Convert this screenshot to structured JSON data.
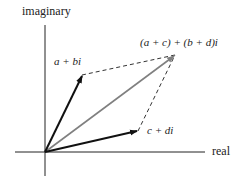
{
  "diagram": {
    "type": "complex-plane vector addition (parallelogram rule)",
    "axes": {
      "x_label": "real",
      "y_label": "imaginary"
    },
    "vectors": [
      {
        "label": "a + bi",
        "from": [
          45,
          152
        ],
        "to": [
          82,
          75
        ],
        "style": "bold black arrow"
      },
      {
        "label": "c + di",
        "from": [
          45,
          152
        ],
        "to": [
          138,
          131
        ],
        "style": "bold black arrow"
      },
      {
        "label": "(a + c) + (b + d)i",
        "from": [
          45,
          152
        ],
        "to": [
          175,
          55
        ],
        "style": "gray arrow"
      }
    ],
    "dashed_edges": [
      {
        "from": [
          82,
          75
        ],
        "to": [
          175,
          55
        ]
      },
      {
        "from": [
          138,
          131
        ],
        "to": [
          175,
          55
        ]
      }
    ],
    "colors": {
      "axes": "#222222",
      "vector": "#111111",
      "sum_vector": "#808080",
      "dashed": "#333333"
    }
  }
}
